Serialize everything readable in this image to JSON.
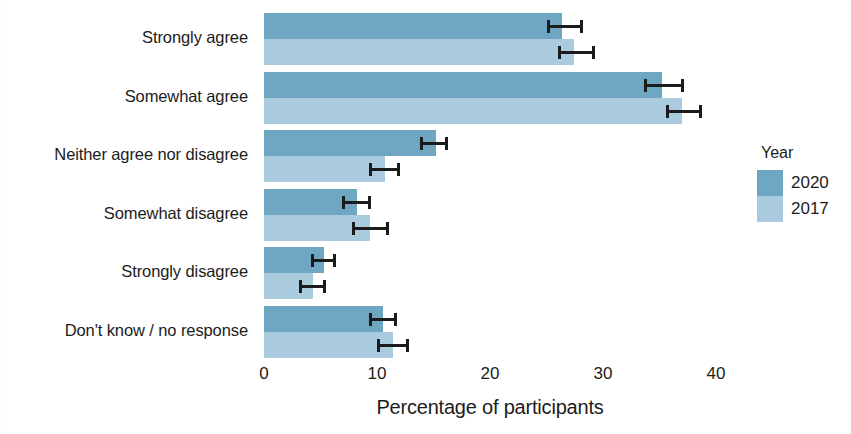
{
  "chart_data": {
    "type": "bar",
    "orientation": "horizontal",
    "title": "",
    "xlabel": "Percentage of participants",
    "ylabel": "",
    "xlim": [
      0,
      40
    ],
    "xticks": [
      0,
      10,
      20,
      30,
      40
    ],
    "xtick_labels": [
      "0",
      "10",
      "20",
      "30",
      "40"
    ],
    "grid": false,
    "legend": {
      "title": "Year",
      "position": "right",
      "entries": [
        {
          "name": "2020",
          "color": "#6fa7c3"
        },
        {
          "name": "2017",
          "color": "#a9cbdd"
        }
      ]
    },
    "categories": [
      "Strongly agree",
      "Somewhat agree",
      "Neither agree nor disagree",
      "Somewhat disagree",
      "Strongly disagree",
      "Don't know / no response"
    ],
    "series": [
      {
        "name": "2020",
        "color": "#6fa7c3",
        "values": [
          26.4,
          35.2,
          15.2,
          8.2,
          5.3,
          10.5
        ],
        "error_low": [
          25.0,
          33.6,
          13.8,
          6.9,
          4.2,
          9.3
        ],
        "error_high": [
          28.2,
          37.2,
          16.3,
          9.5,
          6.4,
          11.8
        ]
      },
      {
        "name": "2017",
        "color": "#a9cbdd",
        "values": [
          27.4,
          37.0,
          10.7,
          9.4,
          4.3,
          11.4
        ],
        "error_low": [
          26.0,
          35.6,
          9.3,
          7.8,
          3.1,
          10.0
        ],
        "error_high": [
          29.3,
          38.8,
          12.0,
          11.1,
          5.5,
          12.8
        ]
      }
    ],
    "error_bar_note": "95% confidence intervals"
  },
  "colors": {
    "series_2020": "#6fa7c3",
    "series_2017": "#a9cbdd",
    "error_bar": "#1b1b1b",
    "text": "#1c1c1c",
    "background": "#ffffff"
  }
}
